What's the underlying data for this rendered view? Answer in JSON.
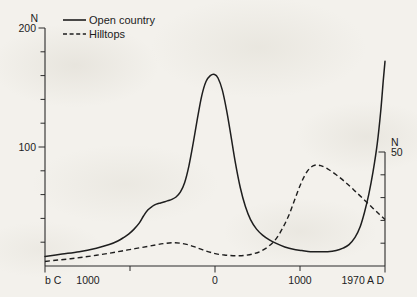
{
  "chart_data": {
    "type": "line",
    "title": "",
    "xlabel": "",
    "ylabel": "N",
    "grid": false,
    "legend_position": "top-left",
    "x_axis": {
      "tick_labels": [
        "b C",
        "1000",
        "0",
        "1000",
        "1970 A D"
      ],
      "tick_positions": [
        -2000,
        -1000,
        0,
        1000,
        1970
      ],
      "range": [
        -2000,
        1970
      ],
      "minor_ticks": [
        -1500,
        -500,
        500,
        1500
      ]
    },
    "y_axis_left": {
      "label": "N",
      "tick_labels": [
        "200",
        "100"
      ],
      "tick_values": [
        200,
        100
      ],
      "range": [
        0,
        200
      ],
      "minor_tick_step": 20
    },
    "y_axis_right": {
      "label": "N",
      "tick_labels": [
        "50"
      ],
      "tick_values": [
        50
      ],
      "range": [
        0,
        50
      ],
      "minor_tick_step": 10
    },
    "series": [
      {
        "name": "Open country",
        "style": "solid",
        "axis": "left",
        "color": "#1e1e1e",
        "x": [
          -2000,
          -1800,
          -1600,
          -1400,
          -1250,
          -1150,
          -1080,
          -1020,
          -960,
          -900,
          -850,
          -800,
          -750,
          -700,
          -650,
          -600,
          -560,
          -520,
          -470,
          -420,
          -370,
          -320,
          -270,
          -220,
          -170,
          -120,
          -70,
          -20,
          20,
          70,
          120,
          170,
          220,
          280,
          340,
          400,
          470,
          540,
          620,
          700,
          800,
          900,
          1000,
          1100,
          1200,
          1300,
          1400,
          1480,
          1550,
          1620,
          1680,
          1730,
          1780,
          1830,
          1880,
          1920,
          1950,
          1970
        ],
        "y": [
          8,
          10,
          12,
          15,
          18,
          21,
          24,
          27,
          31,
          36,
          42,
          47,
          50,
          52,
          53,
          54,
          55,
          56,
          58,
          62,
          70,
          84,
          103,
          124,
          143,
          155,
          160,
          161,
          158,
          148,
          131,
          110,
          88,
          66,
          50,
          39,
          31,
          26,
          22,
          19,
          16,
          14,
          13,
          12,
          12,
          12,
          13,
          15,
          18,
          24,
          33,
          45,
          60,
          79,
          103,
          130,
          156,
          172
        ]
      },
      {
        "name": "Hilltops",
        "style": "dashed",
        "axis": "right",
        "color": "#1e1e1e",
        "x": [
          -2000,
          -1850,
          -1700,
          -1550,
          -1400,
          -1250,
          -1100,
          -950,
          -800,
          -700,
          -620,
          -550,
          -480,
          -420,
          -360,
          -300,
          -240,
          -180,
          -120,
          -60,
          0,
          80,
          160,
          250,
          340,
          430,
          520,
          610,
          700,
          780,
          850,
          910,
          970,
          1030,
          1090,
          1150,
          1220,
          1300,
          1400,
          1500,
          1600,
          1700,
          1800,
          1900,
          1970
        ],
        "y": [
          2.0,
          2.6,
          3.2,
          3.9,
          4.7,
          5.6,
          6.6,
          7.6,
          8.6,
          9.3,
          9.8,
          10.1,
          10.2,
          10.0,
          9.6,
          9.0,
          8.2,
          7.4,
          6.6,
          5.9,
          5.3,
          4.9,
          4.6,
          4.5,
          4.7,
          5.3,
          6.5,
          8.6,
          12.0,
          17.0,
          22.5,
          28.5,
          34.5,
          39.5,
          42.8,
          44.2,
          44.0,
          42.6,
          40.0,
          37.0,
          33.6,
          30.0,
          26.4,
          22.8,
          20.4
        ]
      }
    ],
    "legend": [
      {
        "label": "Open country",
        "style": "solid"
      },
      {
        "label": "Hilltops",
        "style": "dashed"
      }
    ]
  },
  "labels": {
    "left_axis_name": "N",
    "left_tick_200": "200",
    "left_tick_100": "100",
    "right_axis_name": "N",
    "right_tick_50": "50",
    "x_tick_bc": "b C",
    "x_tick_1000bc": "1000",
    "x_tick_0": "0",
    "x_tick_1000ad": "1000",
    "x_tick_1970ad": "1970 A D",
    "legend_open_country": "Open country",
    "legend_hilltops": "Hilltops"
  }
}
